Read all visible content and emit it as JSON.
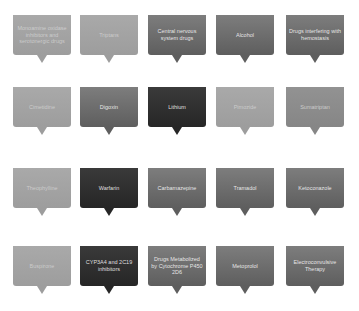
{
  "diagram": {
    "rows": [
      [
        {
          "label": "Monoamine oxidase inhibitors and serotonergic drugs",
          "tone": "light"
        },
        {
          "label": "Triptans",
          "tone": "light"
        },
        {
          "label": "Central nervous system drugs",
          "tone": "mid"
        },
        {
          "label": "Alcohol",
          "tone": "mid"
        },
        {
          "label": "Drugs interfering with hemostasis",
          "tone": "mid"
        }
      ],
      [
        {
          "label": "Cimetidine",
          "tone": "light"
        },
        {
          "label": "Digoxin",
          "tone": "mid"
        },
        {
          "label": "Lithium",
          "tone": "dark"
        },
        {
          "label": "Pimozide",
          "tone": "light"
        },
        {
          "label": "Sumatriptan",
          "tone": "gray"
        }
      ],
      [
        {
          "label": "Theophylline",
          "tone": "light"
        },
        {
          "label": "Warfarin",
          "tone": "dark"
        },
        {
          "label": "Carbamazepine",
          "tone": "mid"
        },
        {
          "label": "Tramadol",
          "tone": "mid"
        },
        {
          "label": "Ketoconazole",
          "tone": "mid"
        }
      ],
      [
        {
          "label": "Buspirone",
          "tone": "light"
        },
        {
          "label": "CYP3A4 and 2C19 inhibitors",
          "tone": "dark"
        },
        {
          "label": "Drugs Metabolized by Cytochrome P450 2D6",
          "tone": "mid"
        },
        {
          "label": "Metoprolol",
          "tone": "mid"
        },
        {
          "label": "Electroconvulsive Therapy",
          "tone": "mid"
        }
      ]
    ],
    "colors": {
      "light": "#a3a3a3",
      "gray": "#8c8c8c",
      "mid": "#6c6c6c",
      "dark": "#2f2f2f",
      "background": "#ffffff"
    }
  }
}
